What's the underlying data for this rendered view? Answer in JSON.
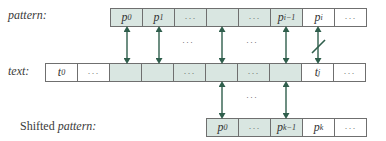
{
  "labels": {
    "pattern": "pattern:",
    "text": "text:",
    "shifted_prefix": "Shifted ",
    "shifted_italic": "pattern:"
  },
  "pattern_row": {
    "cells": [
      {
        "base": "p",
        "sub": "0",
        "shade": "shaded"
      },
      {
        "base": "p",
        "sub": "1",
        "shade": "shaded"
      },
      {
        "base": "···",
        "sub": "",
        "shade": "shaded"
      },
      {
        "base": "",
        "sub": "",
        "shade": "shaded"
      },
      {
        "base": "···",
        "sub": "",
        "shade": "shaded"
      },
      {
        "base": "p",
        "sub": "i−1",
        "shade": "shaded"
      },
      {
        "base": "p",
        "sub": "i",
        "shade": "white"
      },
      {
        "base": "···",
        "sub": "",
        "shade": "white"
      }
    ]
  },
  "text_row": {
    "cells": [
      {
        "base": "t",
        "sub": "0",
        "shade": "white"
      },
      {
        "base": "···",
        "sub": "",
        "shade": "white"
      },
      {
        "base": "",
        "sub": "",
        "shade": "shaded"
      },
      {
        "base": "",
        "sub": "",
        "shade": "shaded"
      },
      {
        "base": "···",
        "sub": "",
        "shade": "shaded"
      },
      {
        "base": "",
        "sub": "",
        "shade": "shaded"
      },
      {
        "base": "···",
        "sub": "",
        "shade": "shaded"
      },
      {
        "base": "",
        "sub": "",
        "shade": "shaded"
      },
      {
        "base": "t",
        "sub": "j",
        "shade": "white"
      },
      {
        "base": "···",
        "sub": "",
        "shade": "white"
      }
    ]
  },
  "shifted_row": {
    "cells": [
      {
        "base": "p",
        "sub": "0",
        "shade": "shaded"
      },
      {
        "base": "···",
        "sub": "",
        "shade": "shaded"
      },
      {
        "base": "p",
        "sub": "k−1",
        "shade": "shaded"
      },
      {
        "base": "p",
        "sub": "k",
        "shade": "white"
      },
      {
        "base": "···",
        "sub": "",
        "shade": "white"
      }
    ]
  },
  "between_dots": {
    "upper_left": "···",
    "upper_right": "···",
    "lower": "···"
  },
  "colors": {
    "shaded_cell": "#d9e6e1",
    "arrow": "#2f5e4c",
    "border": "#6f6f6f"
  }
}
